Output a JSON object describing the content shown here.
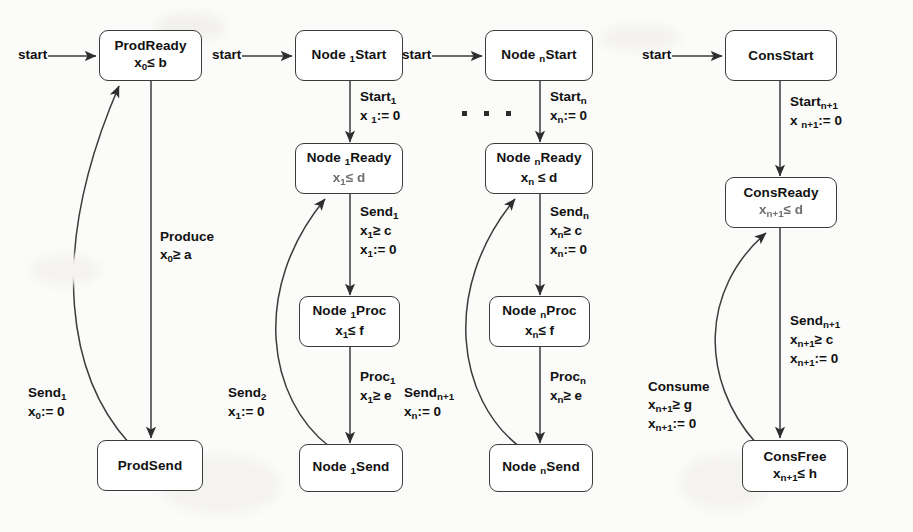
{
  "figure": {
    "type": "timed-automata-state-diagram",
    "background_color": "#fbfbfa",
    "line_color": "#3b3b3b",
    "text_color": "#111111"
  },
  "start_label": "start",
  "ellipsis": "· · ·",
  "columns": [
    {
      "id": "producer",
      "states": [
        {
          "id": "prod-ready",
          "title": "ProdReady",
          "invariant_var": "x",
          "invariant_sub": "0",
          "invariant_rel": "≤",
          "invariant_bound": "b",
          "invariant": "x₀≤ b"
        },
        {
          "id": "prod-send",
          "title": "ProdSend",
          "invariant": ""
        }
      ],
      "transitions": [
        {
          "id": "produce",
          "from": "prod-ready",
          "to": "prod-send",
          "lines": [
            {
              "text": "Produce",
              "sub": ""
            },
            {
              "text": "x",
              "sub": "0",
              "rest": "≥ a"
            }
          ]
        },
        {
          "id": "send-1-back",
          "from": "prod-send",
          "to": "prod-ready",
          "lines": [
            {
              "text": "Send",
              "sub": "1"
            },
            {
              "text": "x",
              "sub": "0",
              "rest": ":= 0"
            }
          ]
        }
      ]
    },
    {
      "id": "node-1",
      "states": [
        {
          "id": "node1-start",
          "title_a": "Node",
          "title_sub": "1",
          "title_b": "Start",
          "invariant": ""
        },
        {
          "id": "node1-ready",
          "title_a": "Node",
          "title_sub": "1",
          "title_b": "Ready",
          "invariant_var": "x",
          "invariant_sub": "1",
          "invariant_rel": "≤",
          "invariant_bound": "d",
          "blurry": true
        },
        {
          "id": "node1-proc",
          "title_a": "Node",
          "title_sub": "1",
          "title_b": "Proc",
          "invariant_var": "x",
          "invariant_sub": "1",
          "invariant_rel": "≤",
          "invariant_bound": "f"
        },
        {
          "id": "node1-send",
          "title_a": "Node",
          "title_sub": "1",
          "title_b": "Send",
          "invariant": ""
        }
      ],
      "transitions": [
        {
          "id": "start-1",
          "lines": [
            {
              "text": "Start",
              "sub": "1"
            },
            {
              "text": "x ",
              "sub": "1",
              "rest": ":= 0"
            }
          ]
        },
        {
          "id": "send-1",
          "lines": [
            {
              "text": "Send",
              "sub": "1"
            },
            {
              "text": "x",
              "sub": "1",
              "rest": "≥ c"
            },
            {
              "text": "x",
              "sub": "1",
              "rest": ":= 0"
            }
          ]
        },
        {
          "id": "proc-1",
          "lines": [
            {
              "text": "Proc",
              "sub": "1"
            },
            {
              "text": "x",
              "sub": "1",
              "rest": "≥ e"
            }
          ]
        },
        {
          "id": "send-2-back",
          "lines": [
            {
              "text": "Send",
              "sub": "2"
            },
            {
              "text": "x",
              "sub": "1",
              "rest": ":= 0"
            }
          ]
        }
      ]
    },
    {
      "id": "node-n",
      "states": [
        {
          "id": "noden-start",
          "title_a": "Node",
          "title_sub": "n",
          "title_b": "Start",
          "invariant": ""
        },
        {
          "id": "noden-ready",
          "title_a": "Node",
          "title_sub": "n",
          "title_b": "Ready",
          "invariant_var": "x",
          "invariant_sub": "n",
          "invariant_rel": "≤",
          "invariant_bound": "d"
        },
        {
          "id": "noden-proc",
          "title_a": "Node",
          "title_sub": "n",
          "title_b": "Proc",
          "invariant_var": "x",
          "invariant_sub": "n",
          "invariant_rel": "≤",
          "invariant_bound": "f"
        },
        {
          "id": "noden-send",
          "title_a": "Node",
          "title_sub": "n",
          "title_b": "Send",
          "invariant": ""
        }
      ],
      "transitions": [
        {
          "id": "start-n",
          "lines": [
            {
              "text": "Start",
              "sub": "n"
            },
            {
              "text": "x",
              "sub": "n",
              "rest": ":= 0"
            }
          ]
        },
        {
          "id": "send-n",
          "lines": [
            {
              "text": "Send",
              "sub": "n"
            },
            {
              "text": "x",
              "sub": "n",
              "rest": "≥ c"
            },
            {
              "text": "x",
              "sub": "n",
              "rest": ":= 0"
            }
          ]
        },
        {
          "id": "proc-n",
          "lines": [
            {
              "text": "Proc",
              "sub": "n"
            },
            {
              "text": "x",
              "sub": "n",
              "rest": "≥ e"
            }
          ]
        },
        {
          "id": "send-n1-back",
          "lines": [
            {
              "text": "Send",
              "sub": "n+1"
            },
            {
              "text": "x",
              "sub": "n",
              "rest": ":= 0"
            }
          ]
        }
      ]
    },
    {
      "id": "consumer",
      "states": [
        {
          "id": "cons-start",
          "title": "ConsStart",
          "invariant": ""
        },
        {
          "id": "cons-ready",
          "title": "ConsReady",
          "invariant_var": "x",
          "invariant_sub": "n+1",
          "invariant_rel": "≤",
          "invariant_bound": "d",
          "blurry": true
        },
        {
          "id": "cons-free",
          "title": "ConsFree",
          "invariant_var": "x",
          "invariant_sub": "n+1",
          "invariant_rel": "≤",
          "invariant_bound": "h"
        }
      ],
      "transitions": [
        {
          "id": "start-n1",
          "lines": [
            {
              "text": "Start",
              "sub": "n+1"
            },
            {
              "text": "x ",
              "sub": "n+1",
              "rest": ":= 0"
            }
          ]
        },
        {
          "id": "send-n1",
          "lines": [
            {
              "text": "Send",
              "sub": "n+1"
            },
            {
              "text": "x",
              "sub": "n+1",
              "rest": "≥ c"
            },
            {
              "text": "x",
              "sub": "n+1",
              "rest": ":= 0"
            }
          ]
        },
        {
          "id": "consume",
          "lines": [
            {
              "text": "Consume",
              "sub": ""
            },
            {
              "text": "x",
              "sub": "n+1",
              "rest": "≥ g"
            },
            {
              "text": "x",
              "sub": "n+1",
              "rest": ":= 0"
            }
          ]
        }
      ]
    }
  ]
}
